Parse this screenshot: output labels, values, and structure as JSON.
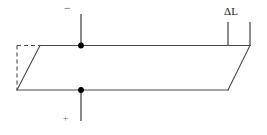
{
  "figure": {
    "background_color": "#ffffff",
    "line_color": "#4a4a4a",
    "dot_color": "#000000"
  },
  "labels": {
    "delta_l": "ΔL",
    "negative_terminal": "−",
    "positive_terminal": "+"
  },
  "geometry": {
    "deformed_shape": {
      "type": "parallelogram",
      "points": "40,45 250,45 228,90 17,90"
    },
    "original_shape": {
      "type": "rectangle-outline-dashed",
      "left_edge": {
        "x1": 17,
        "y1": 45,
        "x2": 17,
        "y2": 90
      },
      "top_edge": {
        "x1": 17,
        "y1": 45,
        "x2": 40,
        "y2": 45
      },
      "right_edge": {
        "x1": 228,
        "y1": 45,
        "x2": 228,
        "y2": 90
      }
    },
    "dimension": {
      "label": "ΔL",
      "tick_left_x": 228,
      "tick_right_x": 250,
      "tick_top_y": 22,
      "tick_bottom_y": 45
    },
    "nodes": [
      {
        "name": "top-node",
        "x": 81,
        "y": 45,
        "r": 2.8
      },
      {
        "name": "bottom-node",
        "x": 81,
        "y": 90,
        "r": 2.8
      }
    ],
    "leads": [
      {
        "name": "top-lead",
        "x1": 81,
        "y1": 14,
        "x2": 81,
        "y2": 45
      },
      {
        "name": "bottom-lead",
        "x1": 81,
        "y1": 90,
        "x2": 81,
        "y2": 121
      }
    ]
  }
}
